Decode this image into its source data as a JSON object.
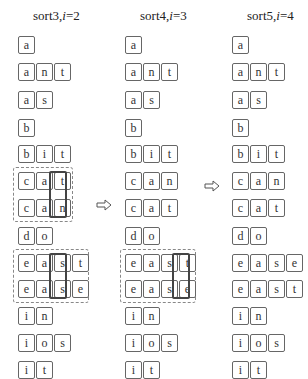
{
  "columns": [
    {
      "title_prefix": "sort3,",
      "title_var": "i",
      "title_suffix": "=2",
      "words": [
        "a",
        "ant",
        "as",
        "b",
        "bit",
        "cat",
        "can",
        "do",
        "east",
        "ease",
        "in",
        "ios",
        "it"
      ],
      "groups": [
        {
          "rows": [
            5,
            6
          ],
          "highlight_col": 2
        },
        {
          "rows": [
            8,
            9
          ],
          "highlight_col": 2
        }
      ]
    },
    {
      "title_prefix": "sort4,",
      "title_var": "i",
      "title_suffix": "=3",
      "words": [
        "a",
        "ant",
        "as",
        "b",
        "bit",
        "can",
        "cat",
        "do",
        "east",
        "ease",
        "in",
        "ios",
        "it"
      ],
      "groups": [
        {
          "rows": [
            8,
            9
          ],
          "highlight_col": 3
        }
      ]
    },
    {
      "title_prefix": "sort5,",
      "title_var": "i",
      "title_suffix": "=4",
      "words": [
        "a",
        "ant",
        "as",
        "b",
        "bit",
        "can",
        "cat",
        "do",
        "ease",
        "east",
        "in",
        "ios",
        "it"
      ],
      "groups": []
    }
  ],
  "arrows": [
    {
      "name": "arrow-right-icon",
      "glyph": "⇨"
    },
    {
      "name": "arrow-right-icon",
      "glyph": "⇨"
    }
  ]
}
